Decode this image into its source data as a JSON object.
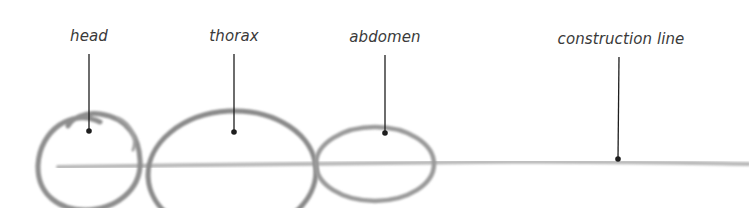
{
  "diagram": {
    "labels": [
      {
        "id": "head",
        "text": "head",
        "x": 89,
        "y": 26,
        "pointer_top": 54,
        "pointer_dot_y": 131
      },
      {
        "id": "thorax",
        "text": "thorax",
        "x": 234,
        "y": 26,
        "pointer_top": 54,
        "pointer_dot_y": 132
      },
      {
        "id": "abdomen",
        "text": "abdomen",
        "x": 385,
        "y": 27,
        "pointer_top": 55,
        "pointer_dot_y": 133
      },
      {
        "id": "construction-line",
        "text": "construction line",
        "x": 619,
        "y": 30,
        "pointer_top": 57,
        "pointer_dot_y": 159
      }
    ],
    "colors": {
      "sketch": "#8c8c8c",
      "construction": "#b5b5b5",
      "pointer": "#1e1e1e",
      "label": "#3a3a3a",
      "background": "#ffffff"
    }
  }
}
